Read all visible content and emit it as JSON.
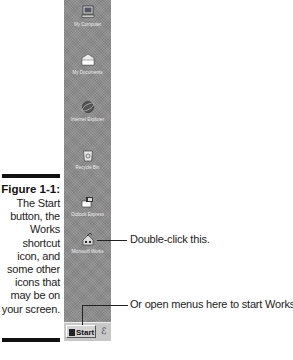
{
  "figure": {
    "number": "Figure 1-1:",
    "caption_lines": [
      "The Start",
      "button, the",
      "Works",
      "shortcut",
      "icon, and",
      "some other",
      "icons that",
      "may be on",
      "your screen."
    ]
  },
  "desktop": {
    "background_color": "#8c8c8c",
    "icons": [
      {
        "name": "my-computer",
        "label": "My Computer",
        "glyph": "monitor-icon"
      },
      {
        "name": "my-documents",
        "label": "My Documents",
        "glyph": "folder-icon"
      },
      {
        "name": "internet-explorer",
        "label": "Internet Explorer",
        "glyph": "globe-icon"
      },
      {
        "name": "recycle-bin",
        "label": "Recycle Bin",
        "glyph": "recycle-bin-icon"
      },
      {
        "name": "outlook-express",
        "label": "Outlook Express",
        "glyph": "mail-icon"
      },
      {
        "name": "microsoft-works",
        "label": "Microsoft Works",
        "glyph": "works-icon"
      }
    ]
  },
  "taskbar": {
    "start_label": "Start",
    "quick_launch_icon": "ie-quicklaunch-icon"
  },
  "callouts": {
    "works_icon": "Double-click this.",
    "start_button": "Or open menus here to start Works."
  }
}
